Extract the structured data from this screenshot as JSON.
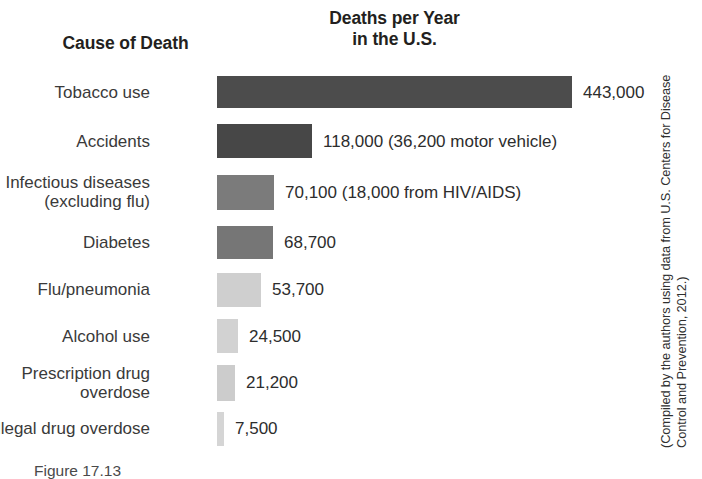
{
  "headers": {
    "cause_of_death": "Cause of Death",
    "deaths_per_year_line1": "Deaths per Year",
    "deaths_per_year_line2": "in the U.S."
  },
  "source_note": {
    "line1": "(Compiled by the authors using data from U.S. Centers for Disease",
    "line2": "Control and Prevention, 2012.)"
  },
  "caption": {
    "figure_number": "Figure",
    "text": "Figure     17.13"
  },
  "colors": {
    "background": "#ffffff",
    "text": "#231f20",
    "label_text": "#3a3a3a",
    "bar_darkest": "#4c4c4c",
    "bar_dark": "#474747",
    "bar_mid": "#7b7b7b",
    "bar_mid2": "#767676",
    "bar_light": "#cfcfcf",
    "bar_lighter": "#d2d2d2",
    "bar_lighter2": "#cccccc",
    "bar_lightest": "#d5d5d5"
  },
  "chart_data": {
    "type": "bar",
    "orientation": "horizontal",
    "title": "Deaths per Year in the U.S.",
    "xlabel": "Deaths per Year in the U.S.",
    "ylabel": "Cause of Death",
    "grid": false,
    "legend": "none",
    "xlim": [
      0,
      443000
    ],
    "categories": [
      "Tobacco use",
      "Accidents",
      "Infectious diseases\n(excluding flu)",
      "Diabetes",
      "Flu/pneumonia",
      "Alcohol use",
      "Prescription drug\noverdose",
      "Illegal drug overdose"
    ],
    "values": [
      443000,
      118000,
      70100,
      68700,
      53700,
      24500,
      21200,
      7500
    ],
    "value_labels": [
      "443,000",
      "118,000 (36,200 motor vehicle)",
      "70,100 (18,000 from HIV/AIDS)",
      "68,700",
      "53,700",
      "24,500",
      "21,200",
      "7,500"
    ],
    "annotations": [
      {
        "category": "Accidents",
        "note": "36,200 motor vehicle",
        "value": 36200
      },
      {
        "category": "Infectious diseases (excluding flu)",
        "note": "18,000 from HIV/AIDS",
        "value": 18000
      }
    ],
    "bars": [
      {
        "label": "Tobacco use",
        "value": 443000,
        "value_label": "443,000",
        "bar_px": 355,
        "row_h": 48,
        "bar_h": 32,
        "color": "#4c4c4c"
      },
      {
        "label": "Accidents",
        "value": 118000,
        "value_label": "118,000 (36,200 motor vehicle)",
        "bar_px": 95,
        "row_h": 50,
        "bar_h": 34,
        "color": "#474747"
      },
      {
        "label": "Infectious diseases\n(excluding flu)",
        "value": 70100,
        "value_label": "70,100 (18,000 from HIV/AIDS)",
        "bar_px": 57,
        "row_h": 52,
        "bar_h": 35,
        "color": "#7b7b7b"
      },
      {
        "label": "Diabetes",
        "value": 68700,
        "value_label": "68,700",
        "bar_px": 56,
        "row_h": 48,
        "bar_h": 33,
        "color": "#767676"
      },
      {
        "label": "Flu/pneumonia",
        "value": 53700,
        "value_label": "53,700",
        "bar_px": 44,
        "row_h": 47,
        "bar_h": 34,
        "color": "#cfcfcf"
      },
      {
        "label": "Alcohol use",
        "value": 24500,
        "value_label": "24,500",
        "bar_px": 21,
        "row_h": 46,
        "bar_h": 34,
        "color": "#d2d2d2"
      },
      {
        "label": "Prescription drug\noverdose",
        "value": 21200,
        "value_label": "21,200",
        "bar_px": 18,
        "row_h": 47,
        "bar_h": 36,
        "color": "#cccccc"
      },
      {
        "label": "Illegal drug overdose",
        "value": 7500,
        "value_label": "7,500",
        "bar_px": 7,
        "row_h": 45,
        "bar_h": 34,
        "color": "#d5d5d5"
      }
    ]
  }
}
